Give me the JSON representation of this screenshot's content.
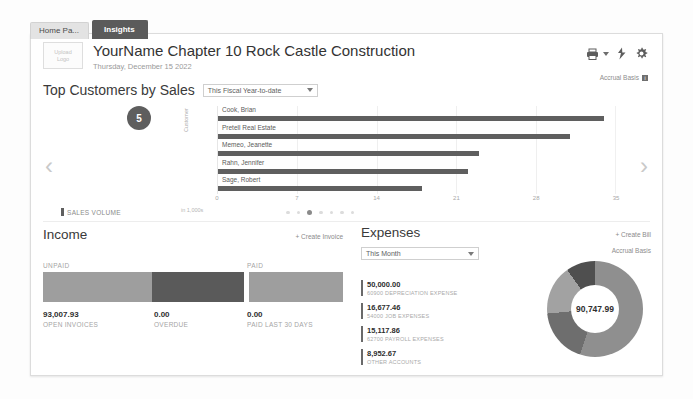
{
  "tabs": [
    {
      "label": "Home Pa...",
      "active": false
    },
    {
      "label": "Insights",
      "active": true
    }
  ],
  "header": {
    "logo_placeholder_line1": "Upload",
    "logo_placeholder_line2": "Logo",
    "company_name": "YourName Chapter 10 Rock Castle Construction",
    "date": "Thursday, December 15 2022",
    "print_icon": "printer-icon",
    "refresh_icon": "lightning-refresh-icon",
    "settings_icon": "gear-icon",
    "accrual_label": "Accrual Basis",
    "info_icon": "info-icon"
  },
  "top_customers": {
    "title": "Top Customers by Sales",
    "period": "This Fiscal Year-to-date",
    "badge_count": "5",
    "prev_icon": "chevron-left-icon",
    "next_icon": "chevron-right-icon",
    "legend": "SALES VOLUME",
    "unit_label": "in 1,000s",
    "axis_title": "Customer",
    "dots_total": 7,
    "dots_active_index": 2
  },
  "income": {
    "title": "Income",
    "create_link": "+ Create Invoice",
    "unpaid_label": "UNPAID",
    "paid_label": "PAID",
    "open_amount": "93,007.93",
    "open_label": "OPEN INVOICES",
    "overdue_amount": "0.00",
    "overdue_label": "OVERDUE",
    "paid_amount": "0.00",
    "paid_last_label": "PAID LAST 30 DAYS"
  },
  "expenses": {
    "title": "Expenses",
    "create_link": "+ Create Bill",
    "period": "This Month",
    "accrual_label": "Accrual Basis",
    "total": "90,747.99",
    "items": [
      {
        "amount": "50,000.00",
        "account": "60900  DEPRECIATION EXPENSE"
      },
      {
        "amount": "16,677.46",
        "account": "54000  JOB EXPENSES"
      },
      {
        "amount": "15,117.86",
        "account": "62700  PAYROLL EXPENSES"
      },
      {
        "amount": "8,952.67",
        "account": "OTHER ACCOUNTS"
      }
    ]
  },
  "colors": {
    "bar": "#5f5f5f",
    "tab_active_bg": "#5b5b5b",
    "unpaid": "#9e9e9e",
    "overdue": "#5a5a5a",
    "paid": "#9e9e9e"
  },
  "chart_data": {
    "type": "bar",
    "orientation": "horizontal",
    "title": "Top Customers by Sales",
    "categories": [
      "Cook, Brian",
      "Pretell Real Estate",
      "Memeo, Jeanette",
      "Rahn, Jennifer",
      "Sage, Robert"
    ],
    "values": [
      34.0,
      31.0,
      23.0,
      22.0,
      18.0
    ],
    "series_name": "SALES VOLUME",
    "xlabel": "in 1,000s",
    "ylabel": "Customer",
    "xlim": [
      0,
      35
    ],
    "xticks": [
      0,
      7,
      14,
      21,
      28,
      35
    ],
    "grid": true,
    "legend_position": "bottom-left"
  },
  "income_chart": {
    "type": "bar",
    "segments": [
      {
        "name": "UNPAID - open invoices",
        "value": 93007.93,
        "width_pct": 37
      },
      {
        "name": "UNPAID - overdue",
        "value": 0,
        "width_pct": 31
      },
      {
        "name": "PAID - last 30 days",
        "value": 0,
        "width_pct": 32
      }
    ]
  },
  "expenses_chart": {
    "type": "pie",
    "variant": "donut",
    "total": 90747.99,
    "labels": [
      "60900 DEPRECIATION EXPENSE",
      "54000 JOB EXPENSES",
      "62700 PAYROLL EXPENSES",
      "OTHER ACCOUNTS"
    ],
    "values": [
      50000.0,
      16677.46,
      15117.86,
      8952.67
    ],
    "center_label": "90,747.99"
  }
}
